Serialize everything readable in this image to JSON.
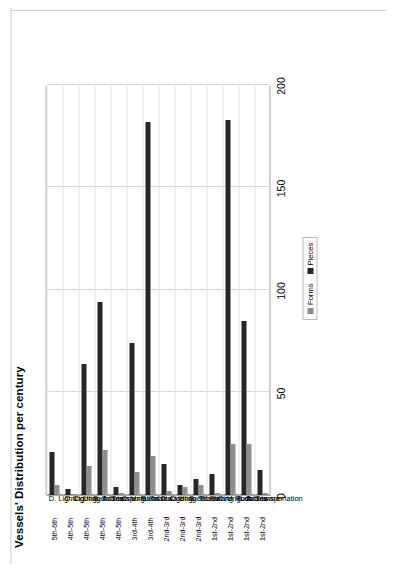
{
  "chart_data": {
    "type": "bar",
    "title": "Vessels' Distribution per century",
    "xlabel": "",
    "ylabel": "",
    "orientation": "vertical",
    "grid": true,
    "legend_position": "bottom-right",
    "ylim": [
      0,
      200
    ],
    "yticks": [
      0,
      50,
      100,
      150,
      200
    ],
    "ytick_labels": [
      "0",
      "50",
      "100",
      "150",
      "200"
    ],
    "categories": [
      "D. Lighting",
      "D. Lighting",
      "C. Unguentaria",
      "B. Tableware",
      "A. Transportation",
      "C. Unguentaria",
      "B. Tableware",
      "D. Lighting",
      "C. Unguentaria",
      "B. Tableware",
      "E. Stirring Rods",
      "C. Unguentaria",
      "B. Tableware",
      "A. Transportation"
    ],
    "centuries": [
      "5th-6th",
      "4th-5th",
      "4th-5th",
      "4th-5th",
      "4th-5th",
      "3rd-4th",
      "3rd-4th",
      "2nd-3rd",
      "2nd-3rd",
      "2nd-3rd",
      "1st-2nd",
      "1st-2nd",
      "1st-2nd",
      "1st-2nd"
    ],
    "series": [
      {
        "name": "Pieces",
        "color": "#262626",
        "values": [
          21,
          3,
          64,
          94,
          4,
          74,
          182,
          15,
          5,
          8,
          10,
          183,
          85,
          12
        ]
      },
      {
        "name": "Forms",
        "color": "#8c8c8c",
        "values": [
          5,
          0,
          14,
          22,
          1,
          11,
          19,
          2,
          4,
          5,
          1,
          25,
          25,
          1
        ]
      }
    ]
  },
  "legend": {
    "items": [
      {
        "label": "Forms",
        "color": "#8c8c8c"
      },
      {
        "label": "Pieces",
        "color": "#262626"
      }
    ]
  }
}
